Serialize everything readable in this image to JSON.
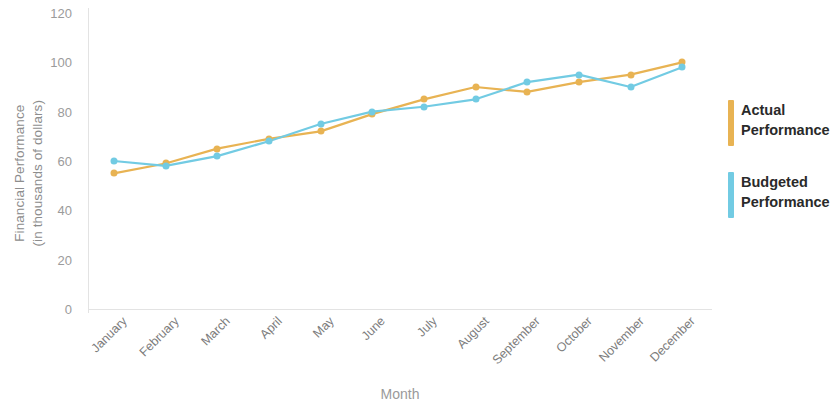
{
  "chart_data": {
    "type": "line",
    "title": "",
    "xlabel": "Month",
    "ylabel": "Financial Performance\n(in thousands of dollars)",
    "categories": [
      "January",
      "February",
      "March",
      "April",
      "May",
      "June",
      "July",
      "August",
      "September",
      "October",
      "November",
      "December"
    ],
    "yticks": [
      0,
      20,
      40,
      60,
      80,
      100,
      120
    ],
    "ylim": [
      0,
      120
    ],
    "grid": false,
    "legend_position": "right",
    "series": [
      {
        "name": "Actual\nPerformance",
        "color": "#e8b353",
        "values": [
          55,
          59,
          65,
          69,
          72,
          79,
          85,
          90,
          88,
          92,
          95,
          100
        ]
      },
      {
        "name": "Budgeted\nPerformance",
        "color": "#72cbe3",
        "values": [
          60,
          58,
          62,
          68,
          75,
          80,
          82,
          85,
          92,
          95,
          90,
          98
        ]
      }
    ]
  },
  "axes": {
    "y_title": "Financial Performance\n(in thousands of dollars)",
    "x_title": "Month"
  },
  "legend": {
    "items": [
      {
        "label": "Actual\nPerformance",
        "color": "#e8b353"
      },
      {
        "label": "Budgeted\nPerformance",
        "color": "#72cbe3"
      }
    ]
  }
}
